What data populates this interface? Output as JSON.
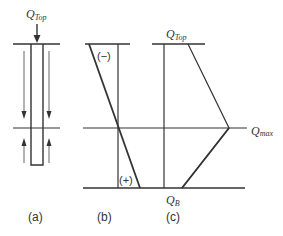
{
  "diagram": {
    "panels": [
      {
        "id": "a",
        "caption": "(a)",
        "description": "pile with applied top load and skin friction arrows"
      },
      {
        "id": "b",
        "caption": "(b)",
        "description": "negative/positive skin friction distribution"
      },
      {
        "id": "c",
        "caption": "(c)",
        "description": "axial load distribution along pile"
      }
    ],
    "labels": {
      "q_top_a": {
        "main": "Q",
        "sub": "Top"
      },
      "q_top_c": {
        "main": "Q",
        "sub": "Top"
      },
      "q_max": {
        "main": "Q",
        "sub": "max"
      },
      "q_b": {
        "main": "Q",
        "sub": "B"
      },
      "negative_sign": "(−)",
      "positive_sign": "(+)"
    },
    "colors": {
      "line": "#333333",
      "background": "#ffffff"
    }
  }
}
